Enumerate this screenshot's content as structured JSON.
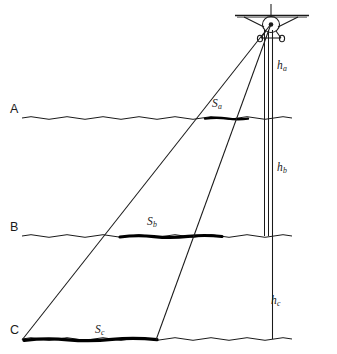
{
  "diagram": {
    "type": "technical-line-diagram",
    "colors": {
      "ink": "#1a1a1a",
      "background": "#ffffff",
      "swath": "#000000"
    },
    "aircraft": {
      "icon_name": "airplane-front-view-icon",
      "x": 271,
      "y": 22
    },
    "levels": [
      {
        "key": "a",
        "label": "A",
        "label_x": 12,
        "label_y": 104,
        "line_y": 118
      },
      {
        "key": "b",
        "label": "B",
        "label_x": 12,
        "label_y": 222,
        "line_y": 236
      },
      {
        "key": "c",
        "label": "C",
        "label_x": 12,
        "label_y": 325,
        "line_y": 339
      }
    ],
    "heights": [
      {
        "key": "ha",
        "base": "h",
        "sub": "a",
        "x": 277,
        "y": 64
      },
      {
        "key": "hb",
        "base": "h",
        "sub": "b",
        "x": 277,
        "y": 166
      },
      {
        "key": "hc",
        "base": "h",
        "sub": "c",
        "x": 272,
        "y": 299
      }
    ],
    "swaths": [
      {
        "key": "Sa",
        "base": "S",
        "sub": "a",
        "x": 214,
        "y": 101,
        "line_y": 118,
        "x_start": 205,
        "x_end": 248
      },
      {
        "key": "Sb",
        "base": "S",
        "sub": "b",
        "x": 150,
        "y": 219,
        "line_y": 236,
        "x_start": 120,
        "x_end": 222
      },
      {
        "key": "Sc",
        "base": "S",
        "sub": "c",
        "x": 98,
        "y": 327,
        "line_y": 339,
        "x_start": 24,
        "x_end": 157
      }
    ],
    "rays": [
      {
        "name": "left-ray",
        "x1": 271,
        "y1": 24,
        "x2": 22,
        "y2": 340
      },
      {
        "name": "right-ray",
        "x1": 271,
        "y1": 24,
        "x2": 156,
        "y2": 340
      }
    ],
    "verticals": [
      {
        "name": "plumb-line-outer-left",
        "x": 264,
        "y1": 28,
        "y2": 236
      },
      {
        "name": "plumb-line-inner",
        "x": 268,
        "y1": 28,
        "y2": 236
      },
      {
        "name": "plumb-line-outer-right",
        "x": 272,
        "y1": 28,
        "y2": 339
      }
    ]
  }
}
